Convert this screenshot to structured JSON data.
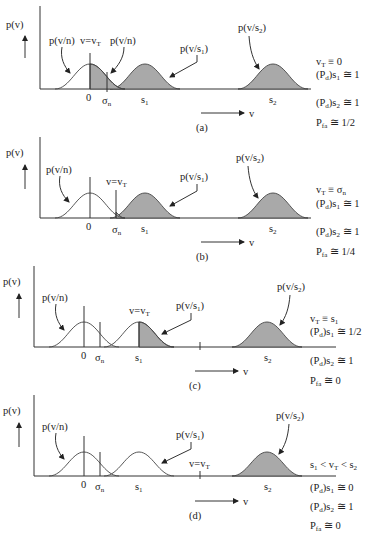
{
  "figure": {
    "y_axis_label": "p(v)",
    "x_axis_label": "v",
    "tick_zero": "0",
    "tick_sigma": "σ",
    "tick_sigma_sub": "n",
    "tick_s1": "s",
    "tick_s1_sub": "1",
    "tick_s2": "s",
    "tick_s2_sub": "2",
    "noise_curve_label": "p(v/n)",
    "s1_curve_label": "p(v/s",
    "s1_curve_label_sub": "1",
    "s2_curve_label": "p(v/s",
    "s2_curve_label_sub": "2",
    "close_paren": ")",
    "threshold_label": "v=v",
    "threshold_label_sub": "T"
  },
  "panels": [
    {
      "id": "a",
      "caption": "(a)",
      "threshold": "0",
      "conditions": [
        {
          "text": "v",
          "sub": "T",
          "rest": " ≡ 0"
        },
        {
          "text": "(P",
          "sub1": "d",
          "mid": ")s",
          "sub2": "1",
          "rest": " ≅ 1"
        },
        {
          "text": "(P",
          "sub1": "d",
          "mid": ")s",
          "sub2": "2",
          "rest": " ≅ 1"
        },
        {
          "text": "P",
          "sub": "fa",
          "rest": " ≅ 1/2"
        }
      ]
    },
    {
      "id": "b",
      "caption": "(b)",
      "threshold": "σn",
      "conditions": [
        {
          "text": "v",
          "sub": "T",
          "rest": " ≡ σ",
          "rest_sub": "n"
        },
        {
          "text": "(P",
          "sub1": "d",
          "mid": ")s",
          "sub2": "1",
          "rest": " ≅ 1"
        },
        {
          "text": "(P",
          "sub1": "d",
          "mid": ")s",
          "sub2": "2",
          "rest": " ≅ 1"
        },
        {
          "text": "P",
          "sub": "fa",
          "rest": " ≅ 1/4"
        }
      ]
    },
    {
      "id": "c",
      "caption": "(c)",
      "threshold": "s1",
      "conditions": [
        {
          "text": "v",
          "sub": "T",
          "rest": " ≡ s",
          "rest_sub": "1"
        },
        {
          "text": "(P",
          "sub1": "d",
          "mid": ")s",
          "sub2": "1",
          "rest": " ≅ 1/2"
        },
        {
          "text": "(P",
          "sub1": "d",
          "mid": ")s",
          "sub2": "2",
          "rest": " ≅ 1"
        },
        {
          "text": "P",
          "sub": "fa",
          "rest": " ≅ 0"
        }
      ]
    },
    {
      "id": "d",
      "caption": "(d)",
      "threshold": "s1 < vT < s2",
      "conditions": [
        {
          "text": "s",
          "sub": "1",
          "rest": " < v",
          "rest_sub": "T",
          "rest2": " < s",
          "rest2_sub": "2"
        },
        {
          "text": "(P",
          "sub1": "d",
          "mid": ")s",
          "sub2": "1",
          "rest": " ≅ 0"
        },
        {
          "text": "(P",
          "sub1": "d",
          "mid": ")s",
          "sub2": "2",
          "rest": " ≅ 1"
        },
        {
          "text": "P",
          "sub": "fa",
          "rest": " ≅ 0"
        }
      ]
    }
  ]
}
